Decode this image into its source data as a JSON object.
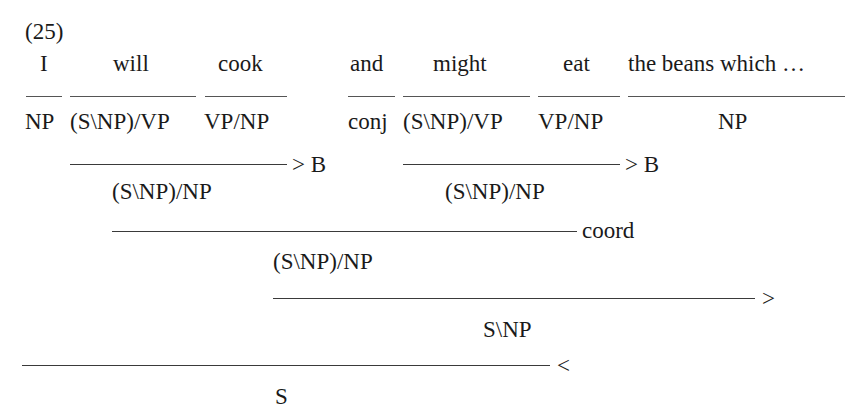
{
  "example_number": "(25)",
  "words": [
    {
      "text": "I",
      "x": 40
    },
    {
      "text": "will",
      "x": 113
    },
    {
      "text": "cook",
      "x": 218
    },
    {
      "text": "and",
      "x": 350
    },
    {
      "text": "might",
      "x": 433
    },
    {
      "text": "eat",
      "x": 563
    },
    {
      "text": "the beans which …",
      "x": 628
    }
  ],
  "lexical_rules": [
    {
      "x1": 26,
      "x2": 62
    },
    {
      "x1": 70,
      "x2": 196
    },
    {
      "x1": 205,
      "x2": 287
    },
    {
      "x1": 348,
      "x2": 395
    },
    {
      "x1": 403,
      "x2": 530
    },
    {
      "x1": 538,
      "x2": 620
    },
    {
      "x1": 628,
      "x2": 845
    }
  ],
  "lexical_categories": [
    {
      "text": "NP",
      "x": 25
    },
    {
      "text": "(S\\NP)/VP",
      "x": 70
    },
    {
      "text": "VP/NP",
      "x": 204
    },
    {
      "text": "conj",
      "x": 348
    },
    {
      "text": "(S\\NP)/VP",
      "x": 403
    },
    {
      "text": "VP/NP",
      "x": 538
    },
    {
      "text": "NP",
      "x": 718
    }
  ],
  "derivation_steps": [
    {
      "id": "compose-left",
      "x1": 70,
      "x2": 287,
      "y": 164,
      "rule": "> B",
      "rule_x": 292,
      "result": "(S\\NP)/NP",
      "result_x": 112,
      "result_y": 180
    },
    {
      "id": "compose-right",
      "x1": 403,
      "x2": 620,
      "y": 164,
      "rule": "> B",
      "rule_x": 625,
      "result": "(S\\NP)/NP",
      "result_x": 445,
      "result_y": 180
    },
    {
      "id": "coordination",
      "x1": 112,
      "x2": 577,
      "y": 231,
      "rule": "coord",
      "rule_x": 582,
      "result": "(S\\NP)/NP",
      "result_x": 273,
      "result_y": 250
    },
    {
      "id": "forward-application",
      "x1": 273,
      "x2": 755,
      "y": 298,
      "rule": ">",
      "rule_x": 762,
      "result": "S\\NP",
      "result_x": 483,
      "result_y": 318
    },
    {
      "id": "backward-application",
      "x1": 22,
      "x2": 550,
      "y": 365,
      "rule": "<",
      "rule_x": 557,
      "result": "S",
      "result_x": 275,
      "result_y": 385
    }
  ]
}
